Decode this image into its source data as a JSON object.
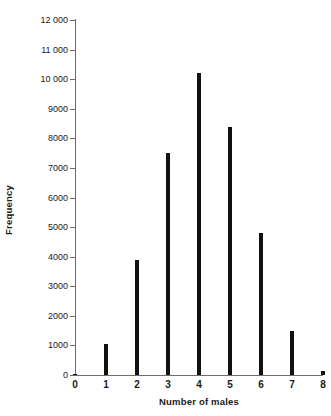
{
  "chart_data": {
    "type": "bar",
    "title": "",
    "subtitle": "",
    "xlabel": "Number of males",
    "ylabel": "Frequency",
    "categories": [
      "0",
      "1",
      "2",
      "3",
      "4",
      "5",
      "6",
      "7",
      "8"
    ],
    "values": [
      50,
      1050,
      3900,
      7500,
      10200,
      8400,
      4800,
      1500,
      150
    ],
    "series": [
      {
        "name": "Frequency",
        "values": [
          50,
          1050,
          3900,
          7500,
          10200,
          8400,
          4800,
          1500,
          150
        ]
      }
    ],
    "xlim": [
      0,
      8
    ],
    "ylim": [
      0,
      12000
    ],
    "y_ticks": [
      0,
      1000,
      2000,
      3000,
      4000,
      5000,
      6000,
      7000,
      8000,
      9000,
      10000,
      11000,
      12000
    ],
    "y_tick_labels": [
      "0",
      "1000",
      "2000",
      "3000",
      "4000",
      "5000",
      "6000",
      "7000",
      "8000",
      "9000",
      "10 000",
      "11 000",
      "12 000"
    ],
    "x_ticks": [
      0,
      1,
      2,
      3,
      4,
      5,
      6,
      7,
      8
    ],
    "x_tick_labels": [
      "0",
      "1",
      "2",
      "3",
      "4",
      "5",
      "6",
      "7",
      "8"
    ],
    "grid": false,
    "legend": false,
    "legend_position": "none",
    "bar_color": "#111111",
    "axis_color": "#6d6d6d",
    "text_color": "#1a1a1a",
    "background_color": "#ffffff"
  }
}
